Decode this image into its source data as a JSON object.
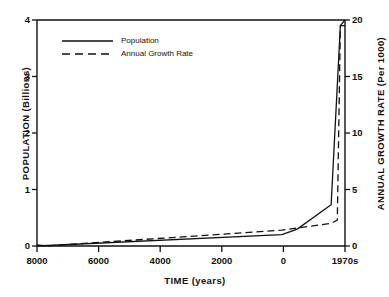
{
  "chart_data": {
    "type": "line",
    "title": "",
    "xlabel": "TIME (years)",
    "ylabel": "POPULATION  (Billions)",
    "ylabel_right": "ANNUAL  GROWTH  RATE  (Per 1000)",
    "grid": false,
    "legend_position": "top-left",
    "x_tick_labels": [
      "8000",
      "6000",
      "4000",
      "2000",
      "0",
      "1970s"
    ],
    "x_tick_positions": [
      0,
      0.2,
      0.4,
      0.6,
      0.8,
      1.0
    ],
    "xlim": [
      8000,
      -1970
    ],
    "ylim": [
      0,
      4
    ],
    "y_tick_labels": [
      "0",
      "1",
      "2",
      "3",
      "4"
    ],
    "ylim_right": [
      0,
      20
    ],
    "y_tick_labels_right": [
      "0",
      "5",
      "10",
      "15",
      "20"
    ],
    "series": [
      {
        "name": "Population",
        "style": "solid",
        "axis": "left",
        "units": "Billions",
        "points": [
          {
            "x": 0.0,
            "y": 0.0
          },
          {
            "x": 0.795,
            "y": 0.2
          },
          {
            "x": 0.845,
            "y": 0.3
          },
          {
            "x": 0.955,
            "y": 0.73
          },
          {
            "x": 0.985,
            "y": 3.9
          },
          {
            "x": 1.0,
            "y": 4.0
          }
        ]
      },
      {
        "name": "Annual Growth Rate",
        "style": "dashed",
        "axis": "right",
        "units": "Per 1000",
        "points": [
          {
            "x": 0.0,
            "y": 0.1
          },
          {
            "x": 0.03,
            "y": 0.0
          },
          {
            "x": 0.795,
            "y": 1.4
          },
          {
            "x": 0.955,
            "y": 2.0
          },
          {
            "x": 0.975,
            "y": 2.3
          },
          {
            "x": 0.985,
            "y": 19.5
          },
          {
            "x": 1.0,
            "y": 19.5
          }
        ]
      }
    ],
    "legend": [
      {
        "label": "Population",
        "style": "solid"
      },
      {
        "label": "Annual Growth Rate",
        "style": "dashed"
      }
    ],
    "colors": {
      "ink": "#111111",
      "background": "#ffffff"
    }
  }
}
